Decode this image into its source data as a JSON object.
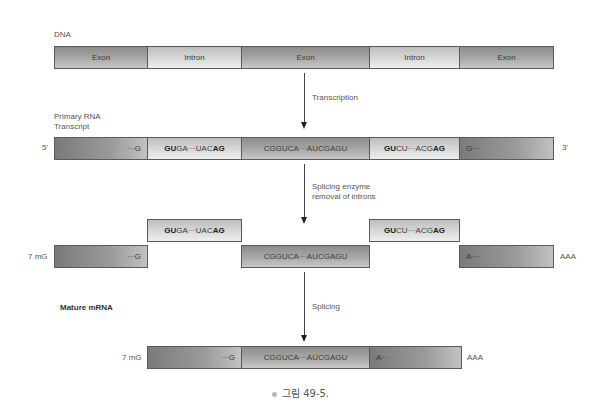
{
  "dna": {
    "label": "DNA",
    "segments": [
      {
        "type": "exon",
        "text": "Exon"
      },
      {
        "type": "intron",
        "text": "Intron"
      },
      {
        "type": "exon",
        "text": "Exon"
      },
      {
        "type": "intron",
        "text": "Intron"
      },
      {
        "type": "exon",
        "text": "Exon"
      }
    ]
  },
  "step1": {
    "label": "Transcription"
  },
  "primary": {
    "label_line1": "Primary RNA",
    "label_line2": "Transcript",
    "five_prime": "5'",
    "three_prime": "3'",
    "segments": [
      {
        "type": "exon",
        "text": "···G"
      },
      {
        "type": "intron",
        "bold_start": "GU",
        "mid": "GA···UAC",
        "bold_end": "AG"
      },
      {
        "type": "exon",
        "text": "CGGUCA···AUCGAGU"
      },
      {
        "type": "intron",
        "bold_start": "GU",
        "mid": "CU···ACG",
        "bold_end": "AG"
      },
      {
        "type": "exon",
        "text": "G···"
      }
    ]
  },
  "step2": {
    "label_line1": "Splicing enzyme",
    "label_line2": "removal of introns"
  },
  "spliced": {
    "cap": "7 mG",
    "tail": "AAA",
    "introns": [
      {
        "bold_start": "GU",
        "mid": "GA···UAC",
        "bold_end": "AG"
      },
      {
        "bold_start": "GU",
        "mid": "CU···ACG",
        "bold_end": "AG"
      }
    ],
    "exons": [
      {
        "text": "···G"
      },
      {
        "text": "CGGUCA···AUCGAGU"
      },
      {
        "text": "A···"
      }
    ]
  },
  "step3": {
    "label": "Splicing"
  },
  "mature": {
    "label": "Mature mRNA",
    "cap": "7 mG",
    "tail": "AAA",
    "segments": [
      {
        "text": "···G"
      },
      {
        "text": "CGGUCA···AUCGAGU"
      },
      {
        "text": "A···"
      }
    ]
  },
  "caption": {
    "text": "그림 49-5."
  }
}
